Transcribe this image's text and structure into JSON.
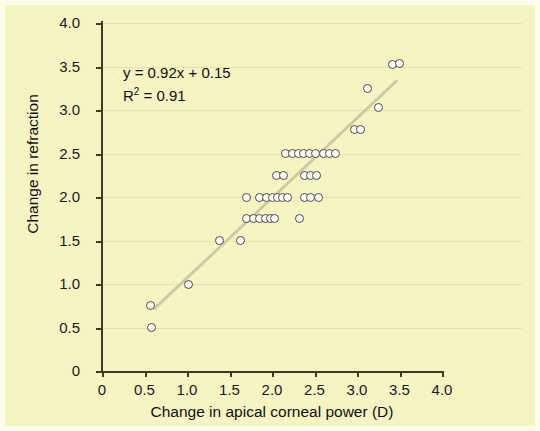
{
  "figure": {
    "background_color": "#f7f4c4",
    "border_color": "#fdfced",
    "axis_color": "#3d3c21",
    "gridline_color": "#e6e2a8",
    "marker_fill": "#fdfdf4",
    "marker_edge": "#4a4a48",
    "trendline_color": "#cfcba0"
  },
  "chart_data": {
    "type": "scatter",
    "title": "",
    "xlabel": "Change in apical corneal power (D)",
    "ylabel": "Change in refraction",
    "xlim": [
      0,
      4.0
    ],
    "ylim": [
      0,
      4.0
    ],
    "xticks": [
      "0",
      "0.5",
      "1.0",
      "1.5",
      "2.0",
      "2.5",
      "3.0",
      "3.5",
      "4.0"
    ],
    "xtick_values": [
      0,
      0.5,
      1.0,
      1.5,
      2.0,
      2.5,
      3.0,
      3.5,
      4.0
    ],
    "yticks": [
      "0",
      "0.5",
      "1.0",
      "1.5",
      "2.0",
      "2.5",
      "3.0",
      "3.5",
      "4.0"
    ],
    "ytick_values": [
      0,
      0.5,
      1.0,
      1.5,
      2.0,
      2.5,
      3.0,
      3.5,
      4.0
    ],
    "grid": "horizontal",
    "legend": "none",
    "annotations": [
      "y = 0.92x + 0.15",
      "R² = 0.91"
    ],
    "equation": "y = 0.92x + 0.15",
    "r_squared": 0.91,
    "slope": 0.92,
    "intercept": 0.15,
    "trendline": {
      "x_start": 0.62,
      "y_start": 0.72,
      "x_end": 3.46,
      "y_end": 3.33
    },
    "points": [
      [
        0.57,
        0.75
      ],
      [
        0.58,
        0.5
      ],
      [
        1.02,
        1.0
      ],
      [
        1.38,
        1.5
      ],
      [
        1.63,
        1.5
      ],
      [
        1.7,
        1.75
      ],
      [
        1.78,
        1.75
      ],
      [
        1.85,
        1.75
      ],
      [
        1.92,
        1.75
      ],
      [
        1.98,
        1.75
      ],
      [
        2.03,
        1.75
      ],
      [
        2.32,
        1.75
      ],
      [
        1.7,
        2.0
      ],
      [
        1.85,
        2.0
      ],
      [
        1.93,
        2.0
      ],
      [
        2.0,
        2.0
      ],
      [
        2.06,
        2.0
      ],
      [
        2.12,
        2.0
      ],
      [
        2.18,
        2.0
      ],
      [
        2.38,
        2.0
      ],
      [
        2.45,
        2.0
      ],
      [
        2.55,
        2.0
      ],
      [
        2.05,
        2.25
      ],
      [
        2.14,
        2.25
      ],
      [
        2.38,
        2.25
      ],
      [
        2.45,
        2.25
      ],
      [
        2.52,
        2.25
      ],
      [
        2.16,
        2.5
      ],
      [
        2.24,
        2.5
      ],
      [
        2.31,
        2.5
      ],
      [
        2.37,
        2.5
      ],
      [
        2.44,
        2.5
      ],
      [
        2.51,
        2.5
      ],
      [
        2.6,
        2.5
      ],
      [
        2.68,
        2.5
      ],
      [
        2.75,
        2.5
      ],
      [
        2.97,
        2.78
      ],
      [
        3.04,
        2.78
      ],
      [
        3.12,
        3.25
      ],
      [
        3.25,
        3.03
      ],
      [
        3.42,
        3.52
      ],
      [
        3.5,
        3.53
      ]
    ]
  }
}
